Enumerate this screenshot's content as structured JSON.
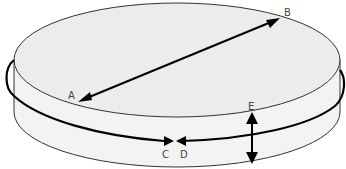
{
  "diagram": {
    "labels": {
      "a": "A",
      "b": "B",
      "c": "C",
      "d": "D",
      "e": "E"
    },
    "colors": {
      "top_fill": "#ececec",
      "side_fill": "#f3f3f3",
      "outline": "#333333",
      "arrow": "#000000",
      "label": "#444444"
    },
    "measurements": [
      {
        "name": "diameter",
        "from": "A",
        "to": "B"
      },
      {
        "name": "circumference",
        "from": "C",
        "to": "D"
      },
      {
        "name": "height",
        "at": "E"
      }
    ]
  }
}
